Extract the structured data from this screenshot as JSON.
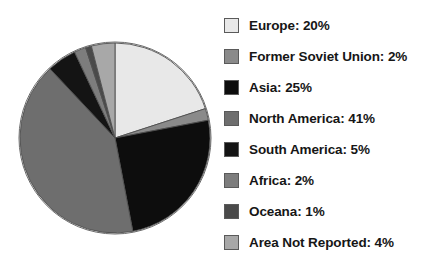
{
  "chart_data": {
    "type": "pie",
    "title": "",
    "subtitle": "",
    "xlabel": "",
    "ylabel": "",
    "grid": false,
    "legend_position": "right",
    "start_angle_deg": 0,
    "direction": "clockwise",
    "units": "%",
    "categories": [
      "Europe",
      "Former Soviet Union",
      "Asia",
      "North America",
      "South America",
      "Africa",
      "Oceana",
      "Area Not Reported"
    ],
    "values": [
      20,
      2,
      25,
      41,
      5,
      2,
      1,
      4
    ],
    "colors": [
      "#e8e8e8",
      "#8a8a8a",
      "#0d0d0d",
      "#6e6e6e",
      "#141414",
      "#7d7d7d",
      "#4a4a4a",
      "#a8a8a8"
    ],
    "slice_outline_color": "#4f4f4f"
  },
  "pie": {
    "center_x": 115,
    "center_y": 138,
    "radius": 95
  },
  "legend": {
    "items": [
      {
        "label": "Europe: 20%",
        "swatch_name": "swatch-europe",
        "color": "#e8e8e8"
      },
      {
        "label": "Former Soviet Union: 2%",
        "swatch_name": "swatch-former-soviet-union",
        "color": "#8a8a8a"
      },
      {
        "label": "Asia: 25%",
        "swatch_name": "swatch-asia",
        "color": "#0d0d0d"
      },
      {
        "label": "North America: 41%",
        "swatch_name": "swatch-north-america",
        "color": "#6e6e6e"
      },
      {
        "label": "South America: 5%",
        "swatch_name": "swatch-south-america",
        "color": "#141414"
      },
      {
        "label": "Africa: 2%",
        "swatch_name": "swatch-africa",
        "color": "#7d7d7d"
      },
      {
        "label": "Oceana: 1%",
        "swatch_name": "swatch-oceana",
        "color": "#4a4a4a"
      },
      {
        "label": "Area Not Reported: 4%",
        "swatch_name": "swatch-area-not-reported",
        "color": "#a8a8a8"
      }
    ]
  }
}
